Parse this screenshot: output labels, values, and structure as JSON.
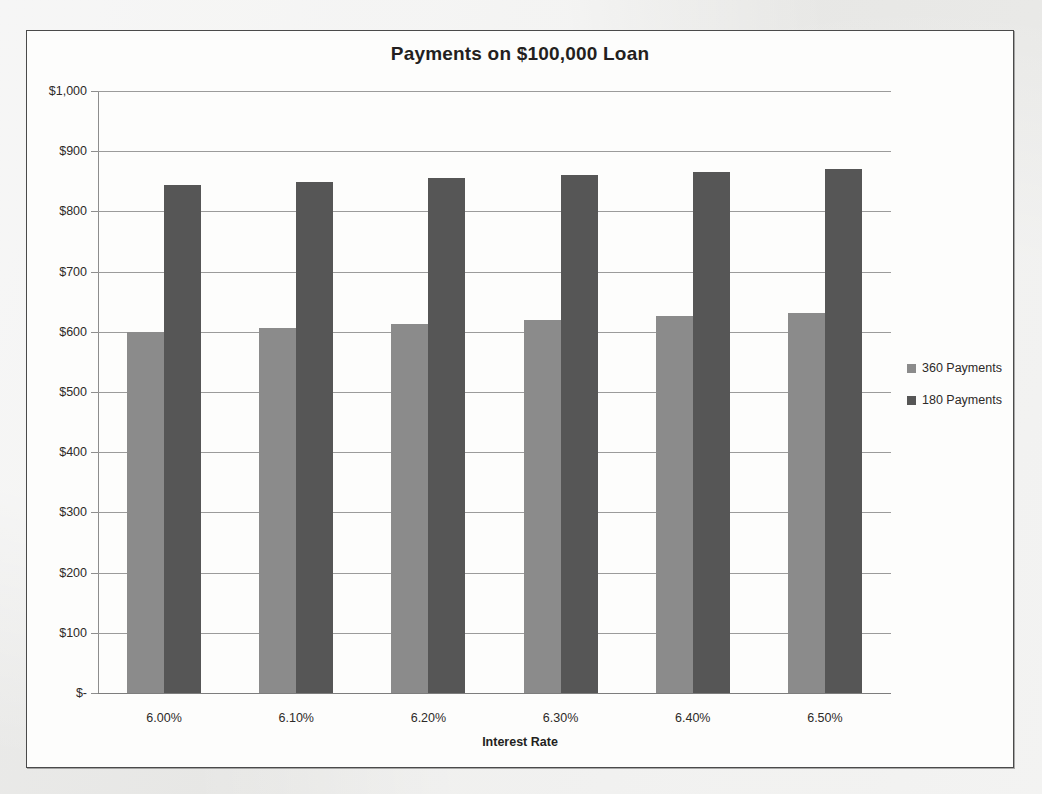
{
  "chart_data": {
    "type": "bar",
    "title": "Payments on $100,000 Loan",
    "xlabel": "Interest Rate",
    "ylabel": "",
    "categories": [
      "6.00%",
      "6.10%",
      "6.20%",
      "6.30%",
      "6.40%",
      "6.50%"
    ],
    "series": [
      {
        "name": "360 Payments",
        "color": "#8b8b8b",
        "values": [
          600,
          607,
          613,
          620,
          626,
          632
        ]
      },
      {
        "name": "180 Payments",
        "color": "#565656",
        "values": [
          844,
          849,
          855,
          860,
          866,
          871
        ]
      }
    ],
    "ylim": [
      0,
      1000
    ],
    "ytick_values": [
      0,
      100,
      200,
      300,
      400,
      500,
      600,
      700,
      800,
      900,
      1000
    ],
    "ytick_labels": [
      "$-",
      "$100",
      "$200",
      "$300",
      "$400",
      "$500",
      "$600",
      "$700",
      "$800",
      "$900",
      "$1,000"
    ],
    "grid": true,
    "legend_position": "right"
  },
  "legend": {
    "items": [
      {
        "label": "360 Payments"
      },
      {
        "label": "180 Payments"
      }
    ]
  }
}
